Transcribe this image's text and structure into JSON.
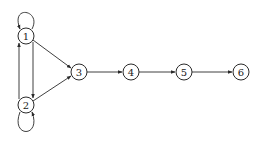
{
  "diagram": {
    "type": "directed-graph",
    "nodes": [
      {
        "id": "1",
        "label": "1",
        "x": 26,
        "y": 36
      },
      {
        "id": "2",
        "label": "2",
        "x": 26,
        "y": 105
      },
      {
        "id": "3",
        "label": "3",
        "x": 79,
        "y": 72
      },
      {
        "id": "4",
        "label": "4",
        "x": 131,
        "y": 72
      },
      {
        "id": "5",
        "label": "5",
        "x": 184,
        "y": 72
      },
      {
        "id": "6",
        "label": "6",
        "x": 241,
        "y": 72
      }
    ],
    "edges": [
      {
        "from": "1",
        "to": "1",
        "kind": "self-loop"
      },
      {
        "from": "2",
        "to": "2",
        "kind": "self-loop"
      },
      {
        "from": "1",
        "to": "2"
      },
      {
        "from": "2",
        "to": "1"
      },
      {
        "from": "1",
        "to": "3"
      },
      {
        "from": "2",
        "to": "3"
      },
      {
        "from": "3",
        "to": "4"
      },
      {
        "from": "4",
        "to": "5"
      },
      {
        "from": "5",
        "to": "6"
      }
    ],
    "stroke_color": "#2a2a2a",
    "background": "#ffffff"
  }
}
